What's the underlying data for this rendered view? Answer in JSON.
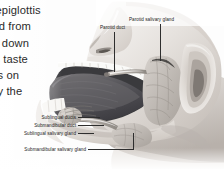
{
  "figure": {
    "kind": "grayscale anatomical illustration",
    "labels": {
      "parotid_duct": "Parotid duct",
      "parotid_salivary_gland": "Parotid salivary gland",
      "sublingual_ducts": "Sublingual ducts",
      "submandibular_duct": "Submandibular duct",
      "sublingual_salivary_gland": "Sublingual salivary gland",
      "submandibular_salivary_gland": "Submandibular salivary gland"
    }
  },
  "body_text": {
    "lines": [
      "e epiglottis",
      "ood from",
      "od down",
      "sic taste",
      "ells on",
      "ally the",
      "ts"
    ]
  },
  "colors": {
    "page_background": "#fdfdfd",
    "body_text": "#2b2b2b",
    "label_text": "#1c1c1c",
    "leader_line": "#2e2e2e",
    "skin_light": "#f2efec",
    "skin_mid": "#d9d4cf",
    "skin_shadow": "#b3aca6",
    "tongue_dark": "#59585a",
    "gland_mid": "#bdb8b3",
    "tooth_white": "#fafaf8"
  }
}
